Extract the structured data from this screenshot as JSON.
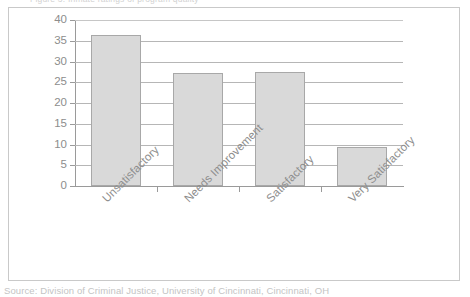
{
  "figure": {
    "top_clipped_text": "Figure 3. Inmate ratings of program quality",
    "source_caption": "Source:   Division of Criminal Justice, University of Cincinnati, Cincinnati, OH"
  },
  "chart_data": {
    "type": "bar",
    "title": "",
    "subtitle": "",
    "xlabel": "",
    "ylabel": "",
    "categories": [
      "Unsatisfactory",
      "Needs Improvement",
      "Satisfactory",
      "Very Satisfactory"
    ],
    "values": [
      36.3,
      27.3,
      27.5,
      9.3
    ],
    "ylim": [
      0,
      40
    ],
    "ytick_step": 5,
    "yticks": [
      40,
      35,
      30,
      25,
      20,
      15,
      10,
      5,
      0
    ],
    "ytick_labels": [
      "40",
      "35",
      "30",
      "25",
      "20",
      "15",
      "10",
      "5",
      "0"
    ],
    "grid": true,
    "grid_axis": "y",
    "legend": false,
    "legend_position": "none",
    "xtick_label_rotation": -45,
    "bar_fill_color": "#d9d9d9",
    "bar_border_color": "#a8a8a8",
    "gridline_color": "#b6b6b6",
    "axis_color": "#9a9a9a",
    "text_color": "#8d8d8d",
    "frame_color": "#c9c9c9",
    "background_color": "#ffffff"
  }
}
